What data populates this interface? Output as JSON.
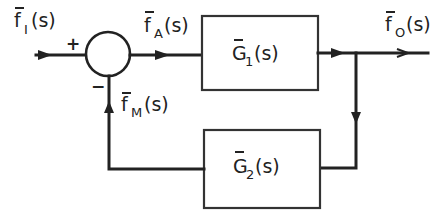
{
  "diagram": {
    "type": "block-diagram-feedback-loop",
    "signals": {
      "input": {
        "base": "f",
        "sub": "I",
        "arg": "(s)"
      },
      "actuating": {
        "base": "f",
        "sub": "A",
        "arg": "(s)"
      },
      "output": {
        "base": "f",
        "sub": "O",
        "arg": "(s)"
      },
      "feedback": {
        "base": "f",
        "sub": "M",
        "arg": "(s)"
      }
    },
    "blocks": {
      "forward": {
        "base": "G",
        "sub": "1",
        "arg": "(s)"
      },
      "feedback": {
        "base": "G",
        "sub": "2",
        "arg": "(s)"
      }
    },
    "summing_junction": {
      "plus_sign": "+",
      "minus_sign": "−"
    },
    "colors": {
      "stroke": "#222222",
      "background": "#ffffff"
    }
  }
}
